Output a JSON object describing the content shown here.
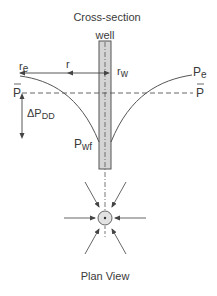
{
  "diagram": {
    "titles": {
      "cross_section": "Cross-section",
      "plan_view": "Plan View"
    },
    "labels": {
      "well": "well",
      "re_main": "r",
      "re_sub": "e",
      "r": "r",
      "rw_main": "r",
      "rw_sub": "w",
      "pe_main": "P",
      "pe_sub": "e",
      "pbar_left": "P",
      "pbar_right": "P",
      "delta_main": "ΔP",
      "delta_sub": "DD",
      "pwf_main": "P",
      "pwf_sub": "wf"
    },
    "colors": {
      "line": "#444444",
      "well_fill": "#d4d4d4",
      "text": "#3a3a3a"
    }
  }
}
